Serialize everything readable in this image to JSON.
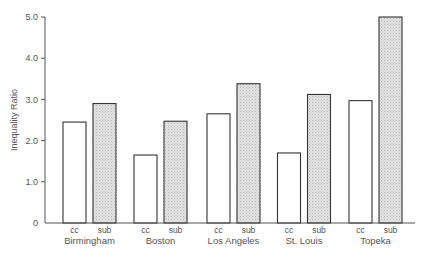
{
  "chart_data": {
    "type": "bar",
    "title": "",
    "xlabel": "",
    "ylabel": "Inequality Ratio",
    "ylim": [
      0,
      5.0
    ],
    "yticks": [
      "0",
      "1.0",
      "2.0",
      "3.0",
      "4.0",
      "5.0"
    ],
    "ytick_values": [
      0,
      1,
      2,
      3,
      4,
      5
    ],
    "grid": false,
    "legend": null,
    "categories": [
      "Birmingham",
      "Boston",
      "Los Angeles",
      "St. Louis",
      "Topeka"
    ],
    "series": [
      {
        "name": "cc",
        "fill": "#ffffff",
        "values": [
          2.45,
          1.65,
          2.65,
          1.7,
          2.97
        ]
      },
      {
        "name": "sub",
        "fill": "#d9d9d9",
        "pattern": "dotted-hatch",
        "values": [
          2.9,
          2.47,
          3.38,
          3.12,
          5.0
        ]
      }
    ]
  },
  "colors": {
    "axis": "#555555",
    "bar_outline": "#333333",
    "cc_fill": "#ffffff",
    "sub_fill": "#d9d9d9"
  }
}
